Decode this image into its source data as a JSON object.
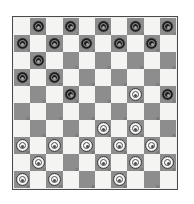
{
  "board": {
    "name": "international-draughts-board",
    "variant": "International Draughts 10x10",
    "rows": 10,
    "cols": 10,
    "numbered_squares": 50,
    "colors": {
      "light_square": "#f4f4f2",
      "dark_square": "#8d8d8d",
      "border": "#4a4a4a",
      "page_background": "#ffffff",
      "dark_piece": "#1d1d1d",
      "light_piece": "#fafafa",
      "square_number_text": "#5e5e5e"
    },
    "square_numbers": [
      1,
      2,
      3,
      4,
      5,
      6,
      7,
      8,
      9,
      10,
      11,
      12,
      13,
      14,
      15,
      16,
      17,
      18,
      19,
      20,
      21,
      22,
      23,
      24,
      25,
      26,
      27,
      28,
      29,
      30,
      31,
      32,
      33,
      34,
      35,
      36,
      37,
      38,
      39,
      40,
      41,
      42,
      43,
      44,
      45,
      46,
      47,
      48,
      49,
      50
    ],
    "pieces": {
      "dark": [
        1,
        2,
        3,
        4,
        5,
        6,
        7,
        8,
        9,
        10,
        11,
        16,
        17,
        22,
        25
      ],
      "light": [
        24,
        33,
        34,
        36,
        37,
        38,
        39,
        40,
        41,
        43,
        44,
        45,
        46,
        47,
        49
      ]
    },
    "counts": {
      "dark_pieces": 15,
      "light_pieces": 15,
      "empty_playing_squares": 20
    }
  }
}
